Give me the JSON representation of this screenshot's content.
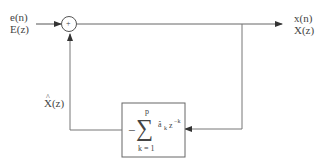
{
  "diagram": {
    "type": "block-diagram",
    "input": {
      "time_label": "e(n)",
      "z_label": "E(z)"
    },
    "output": {
      "time_label": "x(n)",
      "z_label": "X(z)"
    },
    "summing_junction": {
      "symbol": "+"
    },
    "feedback_signal": {
      "label": "X̂(z)",
      "hat": "^",
      "base": "X(z)"
    },
    "predictor_block": {
      "sign": "−",
      "sum_symbol": "∑",
      "upper_limit": "p",
      "lower_limit": "k = 1",
      "coef": "â",
      "coef_sub": "k",
      "z": "z",
      "z_exp": "−k"
    },
    "colors": {
      "line": "#555555",
      "background": "#ffffff"
    }
  }
}
